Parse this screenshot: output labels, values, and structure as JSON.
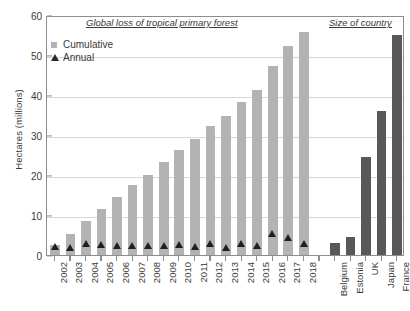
{
  "chart_data": {
    "type": "bar",
    "title": "",
    "xlabel": "",
    "ylabel": "Hectares (millions)",
    "ylim": [
      0,
      60
    ],
    "yticks": [
      0,
      10,
      20,
      30,
      40,
      50,
      60
    ],
    "grid": true,
    "legend_position": "top-left",
    "sections": [
      {
        "header": "Global loss of tropical primary forest",
        "categories": [
          "2002",
          "2003",
          "2004",
          "2005",
          "2006",
          "2007",
          "2008",
          "2009",
          "2010",
          "2011",
          "2012",
          "2013",
          "2014",
          "2015",
          "2016",
          "2017",
          "2018"
        ],
        "series": [
          {
            "name": "Cumulative",
            "type": "bar",
            "color": "#b3b3b3",
            "values": [
              2.6,
              5.2,
              8.5,
              11.6,
              14.4,
              17.4,
              20.1,
              23.3,
              26.2,
              29.0,
              32.3,
              34.7,
              38.3,
              41.2,
              47.2,
              52.2,
              55.8
            ]
          },
          {
            "name": "Annual",
            "type": "marker",
            "marker": "triangle",
            "color": "#1f1f1f",
            "values": [
              2.6,
              2.4,
              3.3,
              3.1,
              2.8,
              3.0,
              2.8,
              3.0,
              3.2,
              2.6,
              3.4,
              2.3,
              3.4,
              2.9,
              6.0,
              5.0,
              3.4
            ]
          }
        ]
      },
      {
        "header": "Size of country",
        "categories": [
          "Belgium",
          "Estonia",
          "UK",
          "Japan",
          "France"
        ],
        "series": [
          {
            "name": "Size of country",
            "type": "bar",
            "color": "#585858",
            "values": [
              3.0,
              4.5,
              24.4,
              36.0,
              55.0
            ]
          }
        ]
      }
    ],
    "legend": [
      {
        "label": "Cumulative",
        "marker": "square",
        "color": "#b3b3b3"
      },
      {
        "label": "Annual",
        "marker": "triangle",
        "color": "#1f1f1f"
      }
    ]
  }
}
